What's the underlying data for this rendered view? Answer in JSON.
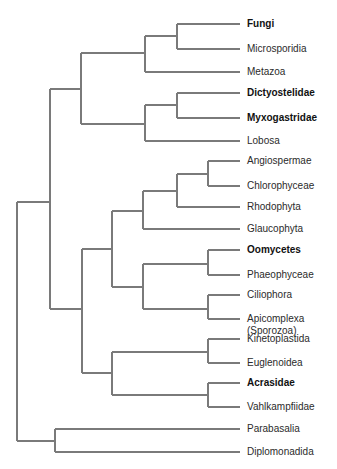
{
  "diagram": {
    "type": "phylogenetic-tree",
    "line_color": "#7a7a7a",
    "text_color": "#2b2b2b",
    "leaves": [
      {
        "label": "Fungi",
        "bold": true,
        "y": 24
      },
      {
        "label": "Microsporidia",
        "bold": false,
        "y": 49
      },
      {
        "label": "Metazoa",
        "bold": false,
        "y": 72
      },
      {
        "label": "Dictyostelidae",
        "bold": true,
        "y": 93
      },
      {
        "label": "Myxogastridae",
        "bold": true,
        "y": 118
      },
      {
        "label": "Lobosa",
        "bold": false,
        "y": 141
      },
      {
        "label": "Angiospermae",
        "bold": false,
        "y": 161
      },
      {
        "label": "Chlorophyceae",
        "bold": false,
        "y": 186
      },
      {
        "label": "Rhodophyta",
        "bold": false,
        "y": 207
      },
      {
        "label": "Glaucophyta",
        "bold": false,
        "y": 229
      },
      {
        "label": "Oomycetes",
        "bold": true,
        "y": 250
      },
      {
        "label": "Phaeophyceae",
        "bold": false,
        "y": 275
      },
      {
        "label": "Ciliophora",
        "bold": false,
        "y": 295
      },
      {
        "label": "Apicomplexa\n(Sporozoa)",
        "bold": false,
        "y": 319
      },
      {
        "label": "Kinetoplastida",
        "bold": false,
        "y": 339
      },
      {
        "label": "Euglenoidea",
        "bold": false,
        "y": 363
      },
      {
        "label": "Acrasidae",
        "bold": true,
        "y": 383
      },
      {
        "label": "Vahlkampfiidae",
        "bold": false,
        "y": 407
      },
      {
        "label": "Parabasalia",
        "bold": false,
        "y": 429
      },
      {
        "label": "Diplomonadida",
        "bold": false,
        "y": 452
      }
    ],
    "segments": [
      [
        177,
        24,
        240,
        24
      ],
      [
        177,
        49,
        240,
        49
      ],
      [
        177,
        24,
        177,
        49
      ],
      [
        145,
        36,
        177,
        36
      ],
      [
        145,
        72,
        240,
        72
      ],
      [
        145,
        36,
        145,
        72
      ],
      [
        81,
        53,
        145,
        53
      ],
      [
        177,
        93,
        240,
        93
      ],
      [
        177,
        118,
        240,
        118
      ],
      [
        177,
        93,
        177,
        118
      ],
      [
        145,
        105,
        177,
        105
      ],
      [
        145,
        141,
        240,
        141
      ],
      [
        145,
        105,
        145,
        141
      ],
      [
        81,
        124,
        145,
        124
      ],
      [
        81,
        53,
        81,
        124
      ],
      [
        50,
        89,
        81,
        89
      ],
      [
        208,
        161,
        240,
        161
      ],
      [
        208,
        186,
        240,
        186
      ],
      [
        208,
        161,
        208,
        186
      ],
      [
        177,
        174,
        208,
        174
      ],
      [
        177,
        207,
        240,
        207
      ],
      [
        177,
        174,
        177,
        207
      ],
      [
        143,
        191,
        177,
        191
      ],
      [
        143,
        229,
        240,
        229
      ],
      [
        143,
        191,
        143,
        229
      ],
      [
        112,
        211,
        143,
        211
      ],
      [
        208,
        250,
        240,
        250
      ],
      [
        208,
        275,
        240,
        275
      ],
      [
        208,
        250,
        208,
        275
      ],
      [
        143,
        264,
        208,
        264
      ],
      [
        208,
        295,
        240,
        295
      ],
      [
        208,
        319,
        240,
        319
      ],
      [
        208,
        295,
        208,
        319
      ],
      [
        143,
        309,
        208,
        309
      ],
      [
        143,
        264,
        143,
        309
      ],
      [
        112,
        287,
        143,
        287
      ],
      [
        112,
        211,
        112,
        287
      ],
      [
        82,
        249,
        112,
        249
      ],
      [
        208,
        339,
        240,
        339
      ],
      [
        208,
        363,
        240,
        363
      ],
      [
        208,
        339,
        208,
        363
      ],
      [
        112,
        352,
        208,
        352
      ],
      [
        208,
        383,
        240,
        383
      ],
      [
        208,
        407,
        240,
        407
      ],
      [
        208,
        383,
        208,
        407
      ],
      [
        112,
        395,
        208,
        395
      ],
      [
        112,
        352,
        112,
        395
      ],
      [
        82,
        373,
        112,
        373
      ],
      [
        82,
        249,
        82,
        373
      ],
      [
        50,
        309,
        82,
        309
      ],
      [
        50,
        89,
        50,
        309
      ],
      [
        17,
        202,
        50,
        202
      ],
      [
        55,
        429,
        240,
        429
      ],
      [
        55,
        452,
        240,
        452
      ],
      [
        55,
        429,
        55,
        452
      ],
      [
        17,
        441,
        55,
        441
      ],
      [
        17,
        202,
        17,
        441
      ]
    ]
  }
}
